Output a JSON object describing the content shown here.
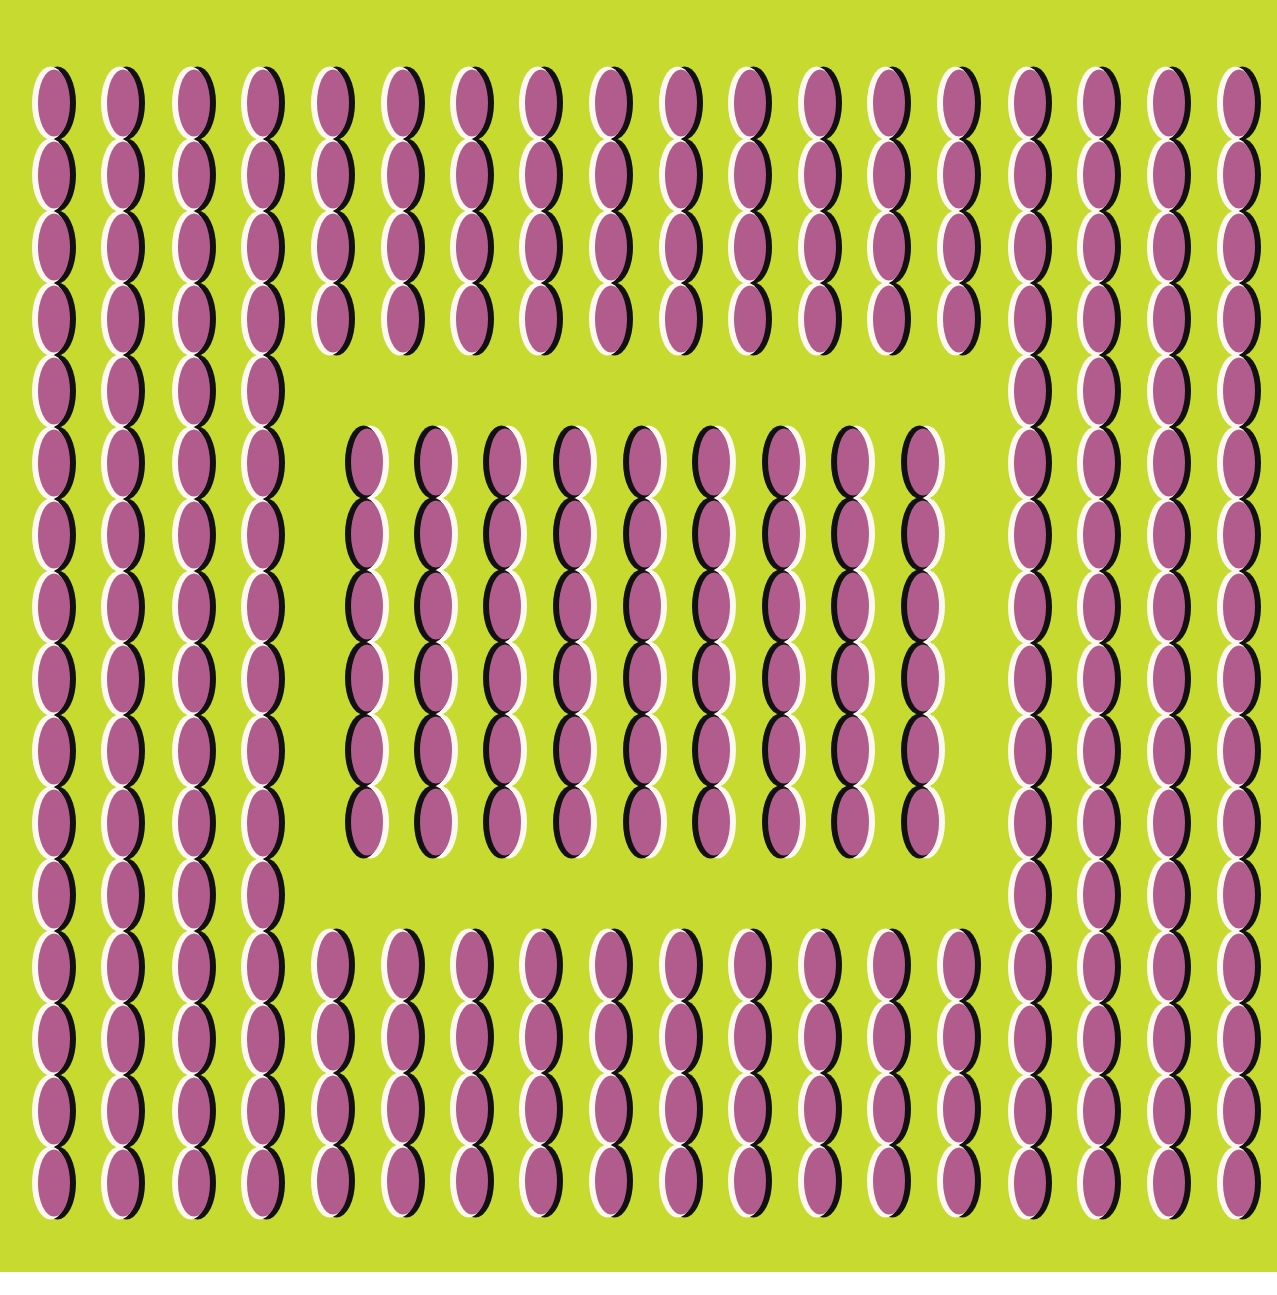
{
  "artwork": {
    "type": "optical-illusion",
    "description": "Rows of vertical pink ellipses with white/black edge crescents on a yellow-green field; a central block has reversed edge polarity",
    "colors": {
      "background": "#c6da2f",
      "paper": "#ffffff",
      "ellipse_fill": "#b15c8c",
      "edge_light": "#fbf9f0",
      "edge_dark": "#111111"
    },
    "field": {
      "x": 0,
      "y": 0,
      "width": 1277,
      "height": 1272
    },
    "ellipse": {
      "rx": 17,
      "ry": 35,
      "edge_offset": 3.5,
      "row_pitch": 72
    },
    "outer_columns_x": [
      54,
      123,
      194,
      263,
      333,
      403,
      472,
      541,
      611,
      681,
      750,
      820,
      889,
      959,
      1030,
      1099,
      1169,
      1239
    ],
    "groups": [
      {
        "name": "outer-left-full-columns",
        "columns": [
          0,
          1,
          2,
          3
        ],
        "y_start": 67,
        "count": 16,
        "polarity": "light-left"
      },
      {
        "name": "outer-right-full-columns",
        "columns": [
          14,
          15,
          16,
          17
        ],
        "y_start": 67,
        "count": 16,
        "polarity": "light-left"
      },
      {
        "name": "top-short-columns",
        "columns": [
          4,
          5,
          6,
          7,
          8,
          9,
          10,
          11,
          12,
          13
        ],
        "y_start": 67,
        "count": 4,
        "polarity": "light-left"
      },
      {
        "name": "bottom-short-columns",
        "columns": [
          4,
          5,
          6,
          7,
          8,
          9,
          10,
          11,
          12,
          13
        ],
        "y_start": 929,
        "count": 4,
        "polarity": "light-left"
      }
    ],
    "inner_block": {
      "name": "inner-reversed-block",
      "columns_x": [
        367,
        436,
        505,
        575,
        645,
        714,
        784,
        853,
        923
      ],
      "y_start": 426,
      "count": 6,
      "polarity": "dark-left"
    }
  }
}
